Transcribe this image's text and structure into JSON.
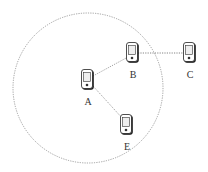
{
  "diagram": {
    "type": "network-range",
    "range_circle": {
      "cx": 88,
      "cy": 88,
      "r": 75,
      "stroke": "#888888",
      "style": "dotted"
    },
    "nodes": [
      {
        "id": "A",
        "label": "A",
        "x": 88,
        "y": 80,
        "label_y": 105
      },
      {
        "id": "B",
        "label": "B",
        "x": 133,
        "y": 53,
        "label_y": 78
      },
      {
        "id": "C",
        "label": "C",
        "x": 190,
        "y": 53,
        "label_y": 78
      },
      {
        "id": "E",
        "label": "E",
        "x": 127,
        "y": 125,
        "label_y": 150
      }
    ],
    "edges": [
      {
        "from": "A",
        "to": "B",
        "style": "dotted"
      },
      {
        "from": "A",
        "to": "E",
        "style": "dotted"
      },
      {
        "from": "B",
        "to": "C",
        "style": "dotted"
      }
    ],
    "icon": "mobile-device-icon"
  }
}
